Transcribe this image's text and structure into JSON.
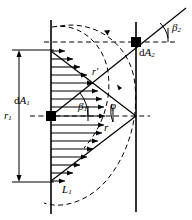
{
  "figure": {
    "name": "radiation-view-factor-diagram",
    "background_color": "#ffffff",
    "line_color": "#000000",
    "width": 192,
    "height": 220
  },
  "labels": {
    "dA1": {
      "prefix": "d",
      "symbol": "A",
      "sub": "1",
      "x": 14,
      "y": 95
    },
    "dA2": {
      "prefix": "d",
      "symbol": "A",
      "sub": "2",
      "x": 139,
      "y": 47
    },
    "r1": {
      "symbol": "r",
      "sub": "1",
      "x": 4,
      "y": 110
    },
    "r": {
      "symbol": "r",
      "sub": "",
      "x": 104,
      "y": 122
    },
    "rprime": {
      "symbol": "r",
      "sub": "",
      "prime": "'",
      "x": 92,
      "y": 67
    },
    "L1": {
      "symbol": "L",
      "sub": "1",
      "x": 62,
      "y": 184
    },
    "beta1": {
      "symbol": "β",
      "sub": "1",
      "x": 78,
      "y": 101
    },
    "beta2": {
      "symbol": "β",
      "sub": "2",
      "x": 172,
      "y": 22
    },
    "phi": {
      "symbol": "φ",
      "sub": "",
      "x": 110,
      "y": 100
    }
  },
  "geometry": {
    "left_wall_x": 51,
    "right_wall_x": 136,
    "left_wall_top_y": 20,
    "left_wall_bottom_y": 214,
    "right_wall_top_y": 22,
    "right_wall_bottom_y": 212,
    "dA1_point": {
      "x": 51,
      "y": 116
    },
    "dA2_point": {
      "x": 136,
      "y": 42
    },
    "vertex_point": {
      "x": 136,
      "y": 116
    },
    "dimension_line_x": 19,
    "dimension_top_y": 50,
    "dimension_bottom_y": 182
  },
  "elements": {
    "left_wall": "vertical-solid-line",
    "right_wall": "vertical-solid-line",
    "dA1_marker": "filled-black-square",
    "dA2_marker": "filled-black-square",
    "arrow_field": "horizontal-arrow-array-cosine-distribution",
    "dashed_circle": "dashed-circle-arc",
    "dashed_ellipse": "dashed-ellipse-arc",
    "centerline": "horizontal-dashed-line",
    "beta1_arc": "angle-arc",
    "beta2_arc": "angle-arc",
    "phi_arc": "angle-arc",
    "dimension_arrow": "vertical-double-headed-arrow"
  },
  "arrow_field_lengths": [
    14,
    22,
    29,
    36,
    42,
    47,
    51,
    53,
    54,
    53,
    51,
    47,
    42,
    36,
    29,
    22,
    14
  ]
}
